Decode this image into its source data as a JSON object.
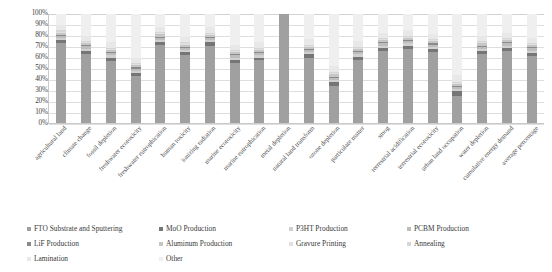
{
  "chart_data": {
    "type": "bar",
    "subtype": "stacked-100-percent",
    "title": "",
    "xlabel": "",
    "ylabel": "",
    "ylim": [
      0,
      100
    ],
    "ytick_labels": [
      "100%",
      "90%",
      "80%",
      "70%",
      "60%",
      "50%",
      "40%",
      "30%",
      "20%",
      "10%",
      "0%"
    ],
    "ytick_values": [
      100,
      90,
      80,
      70,
      60,
      50,
      40,
      30,
      20,
      10,
      0
    ],
    "grid": true,
    "legend_position": "bottom",
    "categories": [
      "agricultural land",
      "climate change",
      "fossil depletion",
      "freshwater ecotoxicity",
      "freshwater eutrophication",
      "human toxicity",
      "ionizing radiation",
      "marine ecotoxicity",
      "marine eutrophication",
      "metal depletion",
      "natural land transform",
      "ozone depletion",
      "particulate matter",
      "smog",
      "terrestrial acidification",
      "terrestrial ecotoxicity",
      "urban land occupation",
      "water depletion",
      "cumulative energy demand",
      "average percentage"
    ],
    "series": [
      {
        "name": "FTO Substrate and Sputtering",
        "color": "#a0a0a0",
        "values": [
          73,
          64,
          57,
          43,
          72,
          62,
          71,
          55,
          58,
          100,
          60,
          34,
          58,
          66,
          68,
          65,
          25,
          63,
          66,
          62
        ]
      },
      {
        "name": "MoO Production",
        "color": "#767676",
        "values": [
          3,
          3,
          3,
          3,
          3,
          3,
          3,
          3,
          2,
          0,
          3,
          4,
          3,
          3,
          3,
          3,
          4,
          3,
          3,
          3
        ]
      },
      {
        "name": "P3HT Production",
        "color": "#d0d0d0",
        "values": [
          2,
          2,
          2,
          2,
          2,
          2,
          2,
          2,
          2,
          0,
          2,
          2,
          2,
          2,
          2,
          2,
          2,
          2,
          2,
          2
        ]
      },
      {
        "name": "PCBM Production",
        "color": "#bdbdbd",
        "values": [
          2,
          2,
          2,
          2,
          2,
          2,
          2,
          2,
          2,
          0,
          2,
          2,
          2,
          2,
          2,
          2,
          2,
          2,
          2,
          2
        ]
      },
      {
        "name": "LiF Production",
        "color": "#8a8a8a",
        "values": [
          1,
          1,
          1,
          1,
          1,
          1,
          1,
          1,
          1,
          0,
          1,
          1,
          1,
          1,
          1,
          1,
          1,
          1,
          1,
          1
        ]
      },
      {
        "name": "Aluminum Production",
        "color": "#c6c6c6",
        "values": [
          2,
          2,
          2,
          2,
          2,
          2,
          2,
          2,
          2,
          0,
          2,
          2,
          2,
          2,
          2,
          2,
          2,
          2,
          2,
          2
        ]
      },
      {
        "name": "Gravure Printing",
        "color": "#e0e0e0",
        "values": [
          1,
          1,
          1,
          1,
          1,
          1,
          1,
          1,
          1,
          0,
          1,
          1,
          1,
          1,
          1,
          1,
          1,
          1,
          1,
          1
        ]
      },
      {
        "name": "Annealing",
        "color": "#d6d6d6",
        "values": [
          1,
          1,
          1,
          1,
          1,
          1,
          1,
          1,
          1,
          0,
          1,
          1,
          1,
          1,
          1,
          1,
          1,
          1,
          1,
          1
        ]
      },
      {
        "name": "Lamination",
        "color": "#e8e8e8",
        "values": [
          5,
          5,
          5,
          5,
          5,
          5,
          5,
          5,
          5,
          0,
          5,
          6,
          5,
          5,
          5,
          5,
          6,
          5,
          5,
          5
        ]
      },
      {
        "name": "Other",
        "color": "#efefef",
        "values": [
          10,
          20,
          26,
          40,
          12,
          21,
          12,
          28,
          26,
          0,
          23,
          48,
          25,
          17,
          15,
          18,
          56,
          20,
          17,
          22
        ]
      }
    ]
  },
  "legend": {
    "items": [
      {
        "label": "FTO Substrate and Sputtering",
        "color": "#a0a0a0"
      },
      {
        "label": "MoO Production",
        "color": "#767676"
      },
      {
        "label": "P3HT Production",
        "color": "#d0d0d0"
      },
      {
        "label": "PCBM Production",
        "color": "#bdbdbd"
      },
      {
        "label": "LiF Production",
        "color": "#8a8a8a"
      },
      {
        "label": "Aluminum Production",
        "color": "#c6c6c6"
      },
      {
        "label": "Gravure Printing",
        "color": "#e0e0e0"
      },
      {
        "label": "Annealing",
        "color": "#d6d6d6"
      },
      {
        "label": "Lamination",
        "color": "#e8e8e8"
      },
      {
        "label": "Other",
        "color": "#efefef"
      }
    ]
  }
}
